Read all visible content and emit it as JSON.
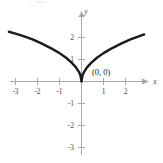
{
  "figure": {
    "background_color": "#ffffff",
    "curve_color": "#1a1a1a",
    "axis_color": "#a8a8a8",
    "label_color": "#4a4a4a"
  },
  "chart_data": {
    "type": "line",
    "title": "",
    "subtitle": "",
    "xlabel": "x",
    "ylabel": "y",
    "xlim": [
      -3.6,
      2.9
    ],
    "ylim": [
      -3.6,
      2.6
    ],
    "grid": false,
    "legend": null,
    "x_ticks": [
      -3,
      -2,
      -1,
      1,
      2
    ],
    "x_tick_labels": [
      "-3",
      "-2",
      "-1",
      "1",
      "2"
    ],
    "y_ticks": [
      -3,
      -2,
      -1,
      1,
      2
    ],
    "y_tick_labels": [
      "-3",
      "-2",
      "-1",
      "1",
      "2"
    ],
    "series": [
      {
        "name": "y = |x|^(1/2)",
        "comment": "cusp at origin, symmetric even function",
        "x": [
          -3.3,
          -3.0,
          -2.6,
          -2.2,
          -1.8,
          -1.4,
          -1.0,
          -0.7,
          -0.45,
          -0.25,
          -0.12,
          -0.05,
          0.0,
          0.05,
          0.12,
          0.25,
          0.45,
          0.7,
          1.0,
          1.4,
          1.8,
          2.2,
          2.6,
          2.85
        ],
        "y": [
          2.26,
          2.18,
          2.05,
          1.9,
          1.72,
          1.52,
          1.29,
          1.08,
          0.86,
          0.64,
          0.44,
          0.29,
          0.0,
          0.29,
          0.44,
          0.64,
          0.86,
          1.08,
          1.29,
          1.52,
          1.72,
          1.9,
          2.05,
          2.14
        ]
      }
    ],
    "annotations": [
      {
        "text": "(0, 0)",
        "x": 0.0,
        "y": 0.0,
        "label_offset_x": 0.45,
        "label_offset_y": 0.55
      }
    ]
  },
  "axes": {
    "x_axis_name": "x",
    "y_axis_name": "y",
    "origin_label": "(0, 0)"
  }
}
